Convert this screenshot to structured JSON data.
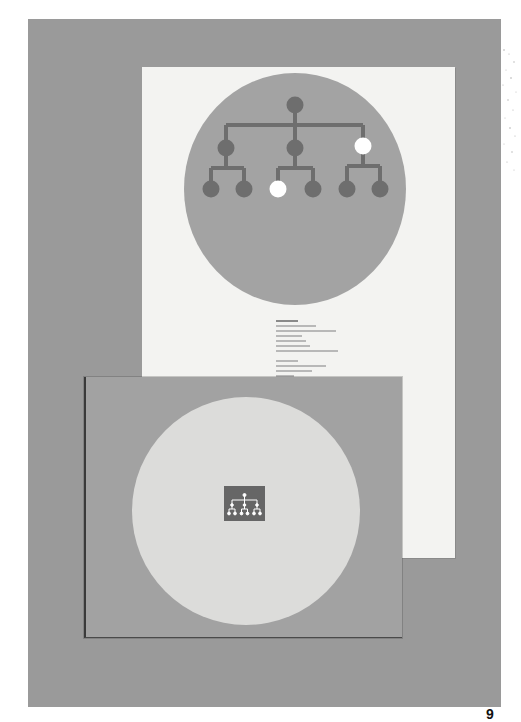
{
  "page": {
    "page_number": "9",
    "colors": {
      "backdrop": "#9a9a9a",
      "white_card": "#f3f3f1",
      "top_circle": "#a3a3a3",
      "tree_nodes": "#6e6e6e",
      "highlight_nodes": "#ffffff",
      "gray_card": "#a2a2a2",
      "light_circle": "#dcdcda",
      "icon_square": "#666666"
    }
  },
  "top_card": {
    "description": "Org-chart tree diagram on gray circle",
    "tree": {
      "root": {
        "x": 295,
        "y": 105,
        "highlight": false
      },
      "level2": [
        {
          "x": 226,
          "y": 148,
          "highlight": false
        },
        {
          "x": 295,
          "y": 148,
          "highlight": false
        },
        {
          "x": 363,
          "y": 146,
          "highlight": true
        }
      ],
      "level3": [
        {
          "x": 211,
          "y": 189,
          "highlight": false
        },
        {
          "x": 244,
          "y": 189,
          "highlight": false
        },
        {
          "x": 278,
          "y": 189,
          "highlight": true
        },
        {
          "x": 313,
          "y": 189,
          "highlight": false
        },
        {
          "x": 347,
          "y": 189,
          "highlight": false
        },
        {
          "x": 380,
          "y": 189,
          "highlight": false
        }
      ]
    },
    "caption_lines": [
      {
        "weight": "bold",
        "width": 22
      },
      {
        "weight": "normal",
        "width": 40
      },
      {
        "weight": "normal",
        "width": 60
      },
      {
        "weight": "normal",
        "width": 26
      },
      {
        "weight": "normal",
        "width": 30
      },
      {
        "weight": "normal",
        "width": 34
      },
      {
        "weight": "normal",
        "width": 62
      },
      {
        "weight": "gap"
      },
      {
        "weight": "normal",
        "width": 22
      },
      {
        "weight": "normal",
        "width": 50
      },
      {
        "weight": "normal",
        "width": 36
      },
      {
        "weight": "normal",
        "width": 18
      },
      {
        "weight": "normal",
        "width": 30
      },
      {
        "weight": "normal",
        "width": 74
      }
    ]
  },
  "bottom_card": {
    "description": "Light circle with small dark square containing white org-chart icon",
    "icon": "org-chart-icon"
  }
}
